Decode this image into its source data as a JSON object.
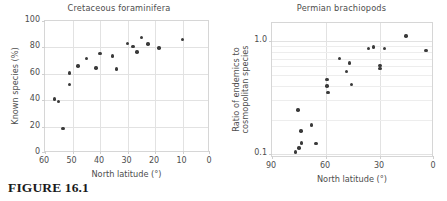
{
  "figure": {
    "caption": "FIGURE 16.1"
  },
  "panels": [
    {
      "id": "cretaceous-foraminifera",
      "title": "Cretaceous foraminifera",
      "xlabel": "North latitude (°)",
      "ylabel": "Known species (%)",
      "xticks": [
        "60",
        "50",
        "40",
        "30",
        "20",
        "10",
        "0"
      ],
      "yticks": [
        "0",
        "20",
        "40",
        "60",
        "80",
        "100"
      ]
    },
    {
      "id": "permian-brachiopods",
      "title": "Permian brachiopods",
      "xlabel": "North latitude (°)",
      "ylabel": "Ratio of endemics to cosmopolitan species",
      "xticks": [
        "90",
        "60",
        "30",
        "0"
      ],
      "yticks": [
        "1.0",
        "0.1"
      ]
    }
  ],
  "chart_data": [
    {
      "type": "scatter",
      "title": "Cretaceous foraminifera",
      "xlabel": "North latitude (°)",
      "ylabel": "Known species (%)",
      "xlim": [
        60,
        0
      ],
      "ylim": [
        0,
        100
      ],
      "xscale": "linear",
      "yscale": "linear",
      "x_reversed": true,
      "grid": true,
      "legend": null,
      "marker_color": "#3a3a3a",
      "xticks": [
        60,
        50,
        40,
        30,
        20,
        10,
        0
      ],
      "yticks": [
        0,
        20,
        40,
        60,
        80,
        100
      ],
      "points": [
        {
          "x": 56.5,
          "y": 41.0
        },
        {
          "x": 55.0,
          "y": 39.0
        },
        {
          "x": 53.5,
          "y": 18.5
        },
        {
          "x": 51.0,
          "y": 60.5
        },
        {
          "x": 51.0,
          "y": 52.0
        },
        {
          "x": 48.0,
          "y": 66.0
        },
        {
          "x": 45.0,
          "y": 71.5
        },
        {
          "x": 41.5,
          "y": 64.5
        },
        {
          "x": 40.0,
          "y": 75.5
        },
        {
          "x": 35.5,
          "y": 73.5
        },
        {
          "x": 34.0,
          "y": 63.5
        },
        {
          "x": 30.0,
          "y": 83.0
        },
        {
          "x": 28.0,
          "y": 80.5
        },
        {
          "x": 26.5,
          "y": 76.5
        },
        {
          "x": 25.0,
          "y": 87.5
        },
        {
          "x": 22.5,
          "y": 82.5
        },
        {
          "x": 18.5,
          "y": 79.5
        },
        {
          "x": 10.0,
          "y": 86.0
        }
      ]
    },
    {
      "type": "scatter",
      "title": "Permian brachiopods",
      "xlabel": "North latitude (°)",
      "ylabel": "Ratio of endemics to cosmopolitan species",
      "xlim": [
        90,
        0
      ],
      "ylim": [
        0.092,
        1.45
      ],
      "xscale": "linear",
      "yscale": "log",
      "x_reversed": true,
      "grid": true,
      "legend": null,
      "marker_color": "#3a3a3a",
      "xticks": [
        90,
        60,
        30,
        0
      ],
      "yticks": [
        1.0,
        0.1
      ],
      "points": [
        {
          "x": 77.0,
          "y": 0.104
        },
        {
          "x": 75.0,
          "y": 0.113
        },
        {
          "x": 73.5,
          "y": 0.125
        },
        {
          "x": 74.0,
          "y": 0.16
        },
        {
          "x": 75.5,
          "y": 0.245
        },
        {
          "x": 68.0,
          "y": 0.18
        },
        {
          "x": 65.5,
          "y": 0.124
        },
        {
          "x": 59.5,
          "y": 0.455
        },
        {
          "x": 59.0,
          "y": 0.35
        },
        {
          "x": 59.5,
          "y": 0.4
        },
        {
          "x": 52.5,
          "y": 0.7
        },
        {
          "x": 48.5,
          "y": 0.54
        },
        {
          "x": 47.0,
          "y": 0.64
        },
        {
          "x": 46.0,
          "y": 0.415
        },
        {
          "x": 36.5,
          "y": 0.86
        },
        {
          "x": 33.5,
          "y": 0.885
        },
        {
          "x": 30.0,
          "y": 0.61
        },
        {
          "x": 30.0,
          "y": 0.57
        },
        {
          "x": 27.5,
          "y": 0.86
        },
        {
          "x": 15.5,
          "y": 1.11
        },
        {
          "x": 4.5,
          "y": 0.825
        }
      ]
    }
  ]
}
